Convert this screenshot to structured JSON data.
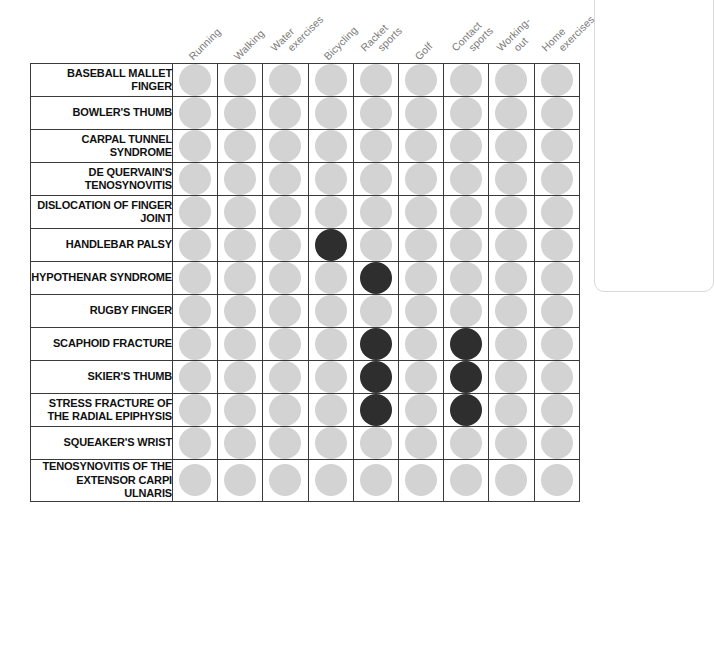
{
  "chart_data": {
    "type": "heatmap",
    "title": "",
    "subtitle": "",
    "xlabel": "",
    "ylabel": "",
    "grid": true,
    "legend_position": "none",
    "categories": [
      "Running",
      "Walking",
      "Water exercises",
      "Bicycling",
      "Racket sports",
      "Golf",
      "Contact sports",
      "Working-out",
      "Home exercises"
    ],
    "column_labels": [
      {
        "line1": "Running",
        "line2": ""
      },
      {
        "line1": "Walking",
        "line2": ""
      },
      {
        "line1": "Water",
        "line2": "exercises"
      },
      {
        "line1": "Bicycling",
        "line2": ""
      },
      {
        "line1": "Racket",
        "line2": "sports"
      },
      {
        "line1": "Golf",
        "line2": ""
      },
      {
        "line1": "Contact",
        "line2": "sports"
      },
      {
        "line1": "Working-",
        "line2": "out"
      },
      {
        "line1": "Home",
        "line2": "exercises"
      }
    ],
    "rows": [
      {
        "label": "BASEBALL MALLET FINGER",
        "values": [
          0,
          0,
          0,
          0,
          0,
          0,
          0,
          0,
          0
        ]
      },
      {
        "label": "BOWLER'S THUMB",
        "values": [
          0,
          0,
          0,
          0,
          0,
          0,
          0,
          0,
          0
        ]
      },
      {
        "label": "CARPAL TUNNEL SYNDROME",
        "values": [
          0,
          0,
          0,
          0,
          0,
          0,
          0,
          0,
          0
        ]
      },
      {
        "label": "DE QUERVAIN'S TENOSYNOVITIS",
        "values": [
          0,
          0,
          0,
          0,
          0,
          0,
          0,
          0,
          0
        ]
      },
      {
        "label": "DISLOCATION OF FINGER JOINT",
        "values": [
          0,
          0,
          0,
          0,
          0,
          0,
          0,
          0,
          0
        ]
      },
      {
        "label": "HANDLEBAR PALSY",
        "values": [
          0,
          0,
          0,
          1,
          0,
          0,
          0,
          0,
          0
        ]
      },
      {
        "label": "HYPOTHENAR SYNDROME",
        "values": [
          0,
          0,
          0,
          0,
          1,
          0,
          0,
          0,
          0
        ]
      },
      {
        "label": "RUGBY FINGER",
        "values": [
          0,
          0,
          0,
          0,
          0,
          0,
          0,
          0,
          0
        ]
      },
      {
        "label": "SCAPHOID FRACTURE",
        "values": [
          0,
          0,
          0,
          0,
          1,
          0,
          1,
          0,
          0
        ]
      },
      {
        "label": "SKIER'S THUMB",
        "values": [
          0,
          0,
          0,
          0,
          1,
          0,
          1,
          0,
          0
        ]
      },
      {
        "label": "STRESS FRACTURE OF THE RADIAL EPIPHYSIS",
        "values": [
          0,
          0,
          0,
          0,
          1,
          0,
          1,
          0,
          0
        ]
      },
      {
        "label": "SQUEAKER'S WRIST",
        "values": [
          0,
          0,
          0,
          0,
          0,
          0,
          0,
          0,
          0
        ]
      },
      {
        "label": "TENOSYNOVITIS OF THE EXTENSOR CARPI ULNARIS",
        "values": [
          0,
          0,
          0,
          0,
          0,
          0,
          0,
          0,
          0
        ]
      }
    ],
    "colors": {
      "dot_off": "#d3d3d3",
      "dot_on": "#2e2e2e",
      "grid_line": "#3a3a3a",
      "row_label_text": "#111111",
      "column_label_text": "#7b7b7b",
      "background": "#ffffff"
    }
  }
}
